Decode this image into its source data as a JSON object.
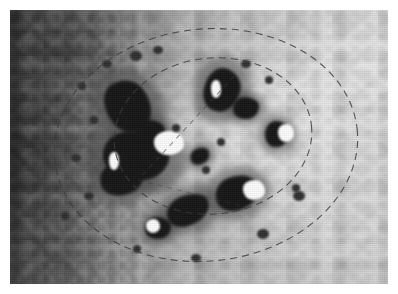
{
  "figure": {
    "kind": "grayscale-surface-photograph",
    "canvas": {
      "width": 398,
      "height": 294,
      "background": "#ffffff"
    },
    "plate": {
      "x": 10,
      "y": 10,
      "width": 378,
      "height": 274
    }
  },
  "image_tone": {
    "illumination": "left-to-right gradient, shadowed left limb to brightly lit right limb",
    "dark_limb_gray": "#343434",
    "mid_gray": "#9a9a9a",
    "bright_limb_gray": "#dfdfdf",
    "shadow_gray": "#151515",
    "highlight_gray": "#fdfdfd"
  },
  "annotations": {
    "stroke_color": "#3c3c3c",
    "stroke_width": 1.1,
    "dash_pattern": "7 5",
    "outer_ellipse": {
      "label": "outer-dashed-ellipse",
      "cx": 196,
      "cy": 135,
      "rx": 152,
      "ry": 116,
      "rotation": -6
    },
    "inner_ellipse": {
      "label": "inner-dashed-ellipse",
      "cx": 203,
      "cy": 126,
      "rx": 99,
      "ry": 78,
      "rotation": -6
    },
    "interior_chord": {
      "label": "interior-dashed-chord",
      "x1": 224,
      "y1": 66,
      "x2": 128,
      "y2": 170,
      "dash_pattern": "5 5",
      "opacity": 0.55
    },
    "secondary_chord": {
      "label": "secondary-dashed-chord",
      "x1": 128,
      "y1": 170,
      "x2": 232,
      "y2": 196,
      "dash_pattern": "5 5",
      "opacity": 0.4
    }
  },
  "features": {
    "dark_shadows": [
      {
        "name": "shadow-upper-left-ridge",
        "cx": 118,
        "cy": 96,
        "rx": 22,
        "ry": 27,
        "rot": -34
      },
      {
        "name": "shadow-left-massif",
        "cx": 126,
        "cy": 146,
        "rx": 33,
        "ry": 24,
        "rot": 12
      },
      {
        "name": "shadow-left-lower-lobe",
        "cx": 112,
        "cy": 168,
        "rx": 22,
        "ry": 17,
        "rot": -10
      },
      {
        "name": "shadow-left-tail",
        "cx": 140,
        "cy": 122,
        "rx": 15,
        "ry": 12,
        "rot": 0
      },
      {
        "name": "shadow-top-center-peak",
        "cx": 212,
        "cy": 80,
        "rx": 18,
        "ry": 22,
        "rot": 14
      },
      {
        "name": "shadow-top-center-east",
        "cx": 236,
        "cy": 98,
        "rx": 13,
        "ry": 11,
        "rot": 0
      },
      {
        "name": "shadow-right-knob",
        "cx": 267,
        "cy": 124,
        "rx": 12,
        "ry": 13,
        "rot": 0
      },
      {
        "name": "shadow-lower-center",
        "cx": 227,
        "cy": 183,
        "rx": 22,
        "ry": 17,
        "rot": -18
      },
      {
        "name": "shadow-lower-left-wedge",
        "cx": 178,
        "cy": 200,
        "rx": 22,
        "ry": 15,
        "rot": -22
      },
      {
        "name": "shadow-bottom-left-knob",
        "cx": 148,
        "cy": 218,
        "rx": 13,
        "ry": 11,
        "rot": 0
      },
      {
        "name": "shadow-center-small",
        "cx": 190,
        "cy": 146,
        "rx": 10,
        "ry": 8,
        "rot": -25
      }
    ],
    "bright_faces": [
      {
        "name": "highlight-left-massif",
        "cx": 159,
        "cy": 133,
        "rx": 15,
        "ry": 12
      },
      {
        "name": "highlight-top-peak",
        "cx": 206,
        "cy": 79,
        "rx": 5,
        "ry": 9
      },
      {
        "name": "highlight-right-knob",
        "cx": 276,
        "cy": 123,
        "rx": 8,
        "ry": 9
      },
      {
        "name": "highlight-lower-center",
        "cx": 244,
        "cy": 180,
        "rx": 11,
        "ry": 10
      },
      {
        "name": "highlight-bottom-knob",
        "cx": 143,
        "cy": 216,
        "rx": 7,
        "ry": 7
      },
      {
        "name": "highlight-left-edge",
        "cx": 104,
        "cy": 151,
        "rx": 5,
        "ry": 9
      }
    ],
    "small_pits": [
      {
        "name": "pit-a",
        "cx": 97,
        "cy": 54,
        "r": 5
      },
      {
        "name": "pit-b",
        "cx": 126,
        "cy": 46,
        "r": 6
      },
      {
        "name": "pit-c",
        "cx": 148,
        "cy": 40,
        "r": 5
      },
      {
        "name": "pit-d",
        "cx": 72,
        "cy": 76,
        "r": 4
      },
      {
        "name": "pit-e",
        "cx": 84,
        "cy": 110,
        "r": 4
      },
      {
        "name": "pit-f",
        "cx": 66,
        "cy": 148,
        "r": 5
      },
      {
        "name": "pit-g",
        "cx": 79,
        "cy": 186,
        "r": 5
      },
      {
        "name": "pit-h",
        "cx": 55,
        "cy": 206,
        "r": 4
      },
      {
        "name": "pit-i",
        "cx": 236,
        "cy": 54,
        "r": 5
      },
      {
        "name": "pit-j",
        "cx": 259,
        "cy": 70,
        "r": 4
      },
      {
        "name": "pit-k",
        "cx": 286,
        "cy": 178,
        "r": 4
      },
      {
        "name": "pit-l",
        "cx": 289,
        "cy": 186,
        "r": 6
      },
      {
        "name": "pit-m",
        "cx": 253,
        "cy": 224,
        "r": 6
      },
      {
        "name": "pit-n",
        "cx": 186,
        "cy": 248,
        "r": 5
      },
      {
        "name": "pit-o",
        "cx": 127,
        "cy": 239,
        "r": 4
      },
      {
        "name": "pit-p",
        "cx": 196,
        "cy": 160,
        "r": 4
      },
      {
        "name": "pit-q",
        "cx": 166,
        "cy": 118,
        "r": 4
      },
      {
        "name": "pit-r",
        "cx": 211,
        "cy": 132,
        "r": 4
      }
    ]
  }
}
